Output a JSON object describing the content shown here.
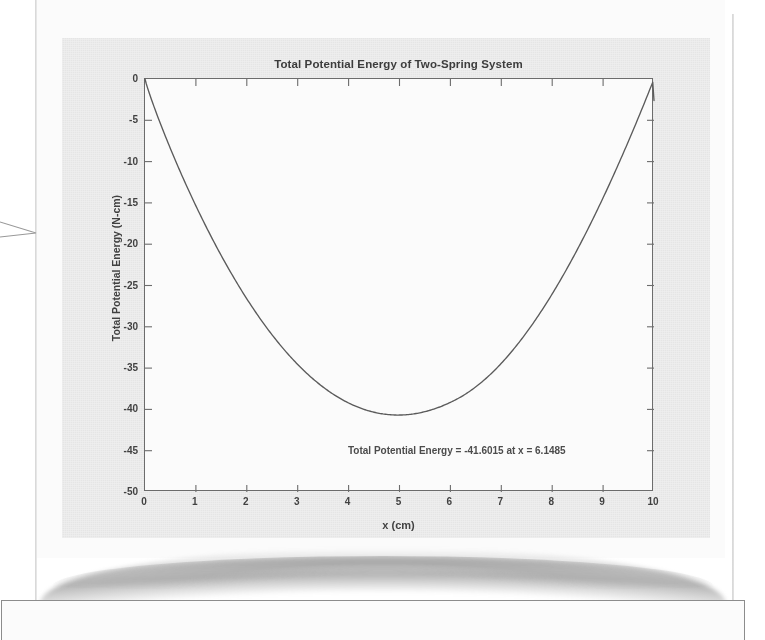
{
  "document": {
    "kind": "scanned-book-page",
    "leader_arrow": "arrow-pointing-right-to-page"
  },
  "figure": {
    "title": "Total Potential Energy of Two-Spring System",
    "xlabel": "x (cm)",
    "ylabel": "Total Potential Energy (N-cm)",
    "annotation": "Total Potential Energy = -41.6015 at x = 6.1485",
    "background_color": "#e8e8e8",
    "axes_color": "#6b6b6b",
    "curve_color": "#5a5a5a",
    "xticks": [
      "0",
      "1",
      "2",
      "3",
      "4",
      "5",
      "6",
      "7",
      "8",
      "9",
      "10"
    ],
    "yticks": [
      "0",
      "-5",
      "-10",
      "-15",
      "-20",
      "-25",
      "-30",
      "-35",
      "-40",
      "-45",
      "-50"
    ]
  },
  "chart_data": {
    "type": "line",
    "title": "Total Potential Energy of Two-Spring System",
    "xlabel": "x (cm)",
    "ylabel": "Total Potential Energy (N-cm)",
    "xlim": [
      0,
      10
    ],
    "ylim": [
      -50,
      0
    ],
    "grid": false,
    "legend": null,
    "annotations": [
      {
        "text": "Total Potential Energy = -41.6015 at x = 6.1485",
        "x": 6.1485,
        "y": -45.1
      }
    ],
    "minimum": {
      "x": 6.1485,
      "y": -41.6015
    },
    "series": [
      {
        "name": "Total Potential Energy",
        "x": [
          0.0,
          0.25,
          0.5,
          0.75,
          1.0,
          1.25,
          1.5,
          1.75,
          2.0,
          2.25,
          2.5,
          2.75,
          3.0,
          3.25,
          3.5,
          3.75,
          4.0,
          4.25,
          4.5,
          4.75,
          5.0,
          5.25,
          5.5,
          5.75,
          6.0,
          6.1485,
          6.25,
          6.5,
          6.75,
          7.0,
          7.25,
          7.5,
          7.75,
          8.0,
          8.25,
          8.5,
          8.75,
          9.0,
          9.25,
          9.5,
          9.75,
          10.0
        ],
        "y": [
          0.0,
          -2.06,
          -4.1,
          -6.12,
          -8.12,
          -10.09,
          -12.03,
          -13.93,
          -15.79,
          -17.6,
          -19.36,
          -21.06,
          -22.69,
          -24.25,
          -25.73,
          -27.12,
          -28.42,
          -29.61,
          -30.69,
          -31.64,
          -32.46,
          -33.13,
          -33.64,
          -33.98,
          -34.12,
          -41.6015,
          -34.07,
          -33.78,
          -33.24,
          -32.43,
          -31.32,
          -29.88,
          -28.1,
          -25.92,
          -23.31,
          -20.22,
          -16.59,
          -12.36,
          -9.8,
          -7.7,
          -5.4,
          -2.6
        ]
      }
    ]
  }
}
